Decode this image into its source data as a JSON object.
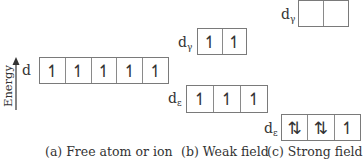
{
  "axis": {
    "label": "Energy",
    "direction": "up"
  },
  "panels": [
    {
      "id": "a",
      "caption": "(a)  Free atom or ion",
      "levels": [
        {
          "label": "d",
          "sub": "",
          "electrons": [
            "↿",
            "↿",
            "↿",
            "↿",
            "↿"
          ]
        }
      ]
    },
    {
      "id": "b",
      "caption": "(b)  Weak field",
      "levels": [
        {
          "label": "d",
          "sub": "γ",
          "electrons": [
            "↿",
            "↿"
          ]
        },
        {
          "label": "d",
          "sub": "ε",
          "electrons": [
            "↿",
            "↿",
            "↿"
          ]
        }
      ]
    },
    {
      "id": "c",
      "caption": "(c)  Strong field",
      "levels": [
        {
          "label": "d",
          "sub": "γ",
          "electrons": [
            "",
            ""
          ]
        },
        {
          "label": "d",
          "sub": "ε",
          "electrons": [
            "⇅",
            "⇅",
            "↿"
          ]
        }
      ]
    }
  ]
}
